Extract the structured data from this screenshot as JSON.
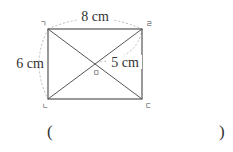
{
  "diagram": {
    "type": "rectangle-with-diagonals",
    "vertices": {
      "top_left": "ㄱ",
      "top_right": "ㄹ",
      "bottom_left": "ㄴ",
      "bottom_right": "ㄷ",
      "center": "ㅁ"
    },
    "measurements": {
      "top": "8 cm",
      "left": "6 cm",
      "half_diagonal": "5 cm"
    }
  },
  "answer": {
    "open": "(",
    "close": ")",
    "value": ""
  }
}
